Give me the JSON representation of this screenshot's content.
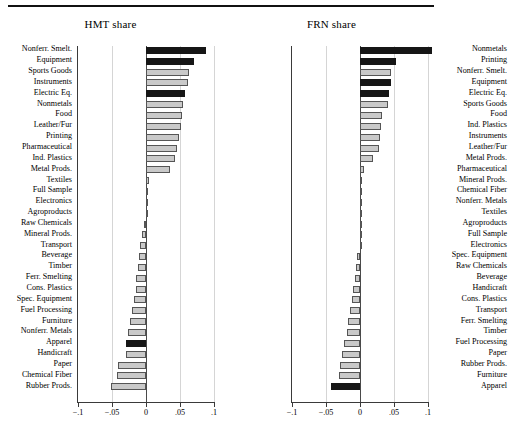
{
  "figure": {
    "background": "#ffffff",
    "bar_light_color": "#c9c9c9",
    "bar_dark_color": "#161616",
    "axis_color": "#3a3a3a",
    "grid_color": "#d5d5d5"
  },
  "chart_data": [
    {
      "type": "bar",
      "orientation": "horizontal",
      "title": "HMT share",
      "xlabel": "",
      "ylabel": "",
      "xlim": [
        -0.1,
        0.1
      ],
      "xticks": [
        -0.1,
        -0.05,
        0,
        0.05,
        0.1
      ],
      "xticklabels": [
        "-.1",
        "-.05",
        "0",
        ".05",
        ".1"
      ],
      "grid": true,
      "legend": "none",
      "categories": [
        "Nonferr. Smelt.",
        "Equipment",
        "Sports Goods",
        "Instruments",
        "Electric Eq.",
        "Nonmetals",
        "Food",
        "Leather/Fur",
        "Printing",
        "Pharmaceutical",
        "Ind. Plastics",
        "Metal Prods.",
        "Textiles",
        "Full Sample",
        "Electronics",
        "Agroproducts",
        "Raw Chemicals",
        "Mineral Prods.",
        "Transport",
        "Beverage",
        "Timber",
        "Ferr. Smelting",
        "Cons. Plastics",
        "Spec. Equipment",
        "Fuel Processing",
        "Furniture",
        "Nonferr. Metals",
        "Apparel",
        "Handicraft",
        "Paper",
        "Chemical Fiber",
        "Rubber Prods."
      ],
      "values": [
        0.088,
        0.07,
        0.063,
        0.062,
        0.058,
        0.055,
        0.053,
        0.052,
        0.049,
        0.045,
        0.042,
        0.036,
        0.004,
        0.003,
        0.003,
        0.0,
        -0.003,
        -0.006,
        -0.009,
        -0.01,
        -0.012,
        -0.014,
        -0.015,
        -0.018,
        -0.021,
        -0.024,
        -0.026,
        -0.029,
        -0.03,
        -0.041,
        -0.043,
        -0.051
      ],
      "highlighted": [
        "Nonferr. Smelt.",
        "Equipment",
        "Electric Eq.",
        "Apparel"
      ]
    },
    {
      "type": "bar",
      "orientation": "horizontal",
      "title": "FRN share",
      "xlabel": "",
      "ylabel": "",
      "xlim": [
        -0.1,
        0.1
      ],
      "xticks": [
        -0.1,
        -0.05,
        0,
        0.05,
        0.1
      ],
      "xticklabels": [
        "-.1",
        "-.05",
        "0",
        ".05",
        ".1"
      ],
      "grid": true,
      "legend": "none",
      "categories": [
        "Nonmetals",
        "Printing",
        "Nonferr. Smelt.",
        "Equipment",
        "Electric Eq.",
        "Sports Goods",
        "Food",
        "Ind. Plastics",
        "Instruments",
        "Leather/Fur",
        "Metal Prods.",
        "Pharmaceutical",
        "Mineral Prods.",
        "Chemical Fiber",
        "Nonferr. Metals",
        "Textiles",
        "Agroproducts",
        "Full Sample",
        "Electronics",
        "Spec. Equipment",
        "Raw Chemicals",
        "Beverage",
        "Handicraft",
        "Cons. Plastics",
        "Transport",
        "Ferr. Smelting",
        "Timber",
        "Fuel Processing",
        "Paper",
        "Rubber Prods.",
        "Furniture",
        "Apparel"
      ],
      "values": [
        0.106,
        0.053,
        0.046,
        0.045,
        0.043,
        0.041,
        0.032,
        0.031,
        0.03,
        0.028,
        0.019,
        0.006,
        0.003,
        0.003,
        0.002,
        0.002,
        0.002,
        0.001,
        0.0,
        -0.004,
        -0.006,
        -0.007,
        -0.011,
        -0.012,
        -0.015,
        -0.018,
        -0.019,
        -0.023,
        -0.027,
        -0.029,
        -0.031,
        -0.042
      ],
      "highlighted": [
        "Nonmetals",
        "Printing",
        "Equipment",
        "Electric Eq.",
        "Apparel"
      ]
    }
  ]
}
